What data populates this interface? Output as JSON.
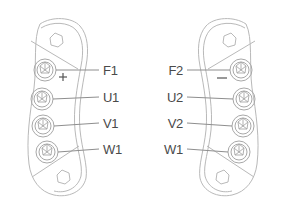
{
  "diagram": {
    "background_color": "#ffffff",
    "outline_color": "#b9b9b9",
    "label_color": "#4a4a4a",
    "leader_color": "#8e8e8e"
  },
  "blocks": [
    {
      "id": "left-terminal-block",
      "name": "Left Terminal Block",
      "label_side": "right",
      "polarity_symbol": "+",
      "mount_holes": 2,
      "terminals": [
        {
          "label": "F1",
          "index": 0
        },
        {
          "label": "U1",
          "index": 1
        },
        {
          "label": "V1",
          "index": 2
        },
        {
          "label": "W1",
          "index": 3
        }
      ]
    },
    {
      "id": "right-terminal-block",
      "name": "Right Terminal Block",
      "label_side": "left",
      "polarity_symbol": "–",
      "mount_holes": 2,
      "terminals": [
        {
          "label": "F2",
          "index": 0
        },
        {
          "label": "U2",
          "index": 1
        },
        {
          "label": "V2",
          "index": 2
        },
        {
          "label": "W1",
          "index": 3
        }
      ]
    }
  ],
  "icons": {
    "screw_terminal": "screw-terminal-icon",
    "mount_hole": "mounting-hole-icon"
  }
}
